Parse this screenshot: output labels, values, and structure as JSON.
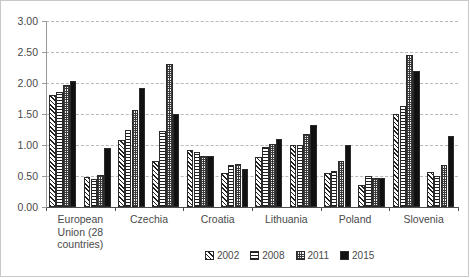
{
  "chart_data": {
    "type": "bar",
    "title": "",
    "xlabel": "",
    "ylabel": "",
    "ylim": [
      0,
      3.0
    ],
    "ytick_step": 0.5,
    "ytick_labels": [
      "0.00",
      "0.50",
      "1.00",
      "1.50",
      "2.00",
      "2.50",
      "3.00"
    ],
    "grid": true,
    "legend_position": "bottom",
    "categories": [
      "European Union (28 countries)",
      "",
      "Czechia",
      "",
      "Croatia",
      "",
      "Lithuania",
      "",
      "Poland",
      "",
      "Slovenia",
      ""
    ],
    "visible_tick_labels": [
      {
        "index": 0,
        "label_lines": [
          "European",
          "Union (28",
          "countries)"
        ]
      },
      {
        "index": 2,
        "label_lines": [
          "Czechia"
        ]
      },
      {
        "index": 4,
        "label_lines": [
          "Croatia"
        ]
      },
      {
        "index": 6,
        "label_lines": [
          "Lithuania"
        ]
      },
      {
        "index": 8,
        "label_lines": [
          "Poland"
        ]
      },
      {
        "index": 10,
        "label_lines": [
          "Slovenia"
        ]
      }
    ],
    "series": [
      {
        "name": "2002",
        "pattern": "diagonal-hatch",
        "color": "#ffffff",
        "values": [
          1.8,
          0.48,
          1.08,
          0.75,
          0.92,
          0.55,
          0.8,
          1.0,
          0.55,
          0.36,
          1.5,
          0.56
        ]
      },
      {
        "name": "2008",
        "pattern": "horizontal-lines",
        "color": "#ffffff",
        "values": [
          1.85,
          0.45,
          1.25,
          1.23,
          0.88,
          0.68,
          0.97,
          1.0,
          0.58,
          0.5,
          1.63,
          0.5
        ]
      },
      {
        "name": "2011",
        "pattern": "checker",
        "color": "#f2f2f2",
        "values": [
          1.97,
          0.52,
          1.57,
          2.31,
          0.82,
          0.7,
          1.02,
          1.18,
          0.74,
          0.46,
          2.45,
          0.68
        ]
      },
      {
        "name": "2015",
        "pattern": "solid",
        "color": "#111111",
        "values": [
          2.03,
          0.95,
          1.92,
          1.5,
          0.83,
          0.62,
          1.1,
          1.32,
          1.0,
          0.46,
          2.19,
          1.15
        ]
      }
    ]
  },
  "legend": {
    "items": [
      {
        "label": "2002"
      },
      {
        "label": "2008"
      },
      {
        "label": "2011"
      },
      {
        "label": "2015"
      }
    ]
  }
}
